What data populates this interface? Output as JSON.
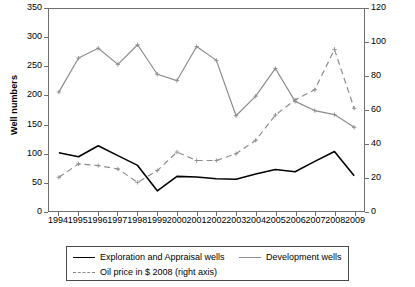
{
  "chart_data": {
    "type": "line",
    "title": "",
    "xlabel": "",
    "ylabel": "Well numbers",
    "ylabel_right": "",
    "grid": false,
    "legend_position": "bottom",
    "categories": [
      "1994",
      "1995",
      "1996",
      "1997",
      "1998",
      "1999",
      "2000",
      "2001",
      "2002",
      "2003",
      "2004",
      "2005",
      "2006",
      "2007",
      "2008",
      "2009"
    ],
    "ylim": [
      0,
      350
    ],
    "yticks": [
      0,
      50,
      100,
      150,
      200,
      250,
      300,
      350
    ],
    "ylim_right": [
      0,
      120
    ],
    "yticks_right": [
      0,
      20,
      40,
      60,
      80,
      100,
      120
    ],
    "series": [
      {
        "name": "Exploration and Appraisal wells",
        "axis": "left",
        "style": "solid",
        "color": "#000000",
        "values": [
          101,
          94,
          113,
          96,
          79,
          35,
          60,
          59,
          56,
          55,
          64,
          72,
          68,
          86,
          103,
          61
        ]
      },
      {
        "name": "Development wells",
        "axis": "left",
        "style": "solid",
        "color": "#8c8c8c",
        "values": [
          206,
          265,
          282,
          254,
          288,
          237,
          226,
          285,
          261,
          165,
          199,
          247,
          190,
          174,
          167,
          145
        ]
      },
      {
        "name": "Oil price in $ 2008 (right axis)",
        "axis": "right",
        "style": "dashed",
        "color": "#8c8c8c",
        "values": [
          20,
          28,
          27,
          25,
          17,
          24,
          35,
          30,
          30,
          34,
          42,
          57,
          66,
          72,
          96,
          61
        ]
      }
    ]
  },
  "axes": {
    "left_title": "Well numbers"
  },
  "legend": {
    "entries": [
      {
        "label": "Exploration and Appraisal wells",
        "icon": "solid-black-line-icon"
      },
      {
        "label": "Development wells",
        "icon": "solid-grey-line-icon"
      },
      {
        "label": "Oil price in $ 2008 (right axis)",
        "icon": "dashed-grey-line-icon"
      }
    ]
  }
}
